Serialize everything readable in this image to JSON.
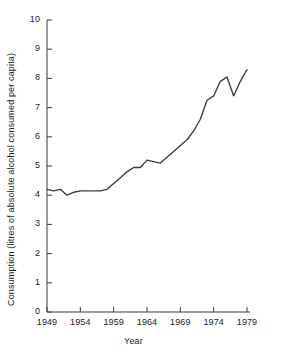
{
  "chart_data": {
    "type": "line",
    "title": "",
    "subtitle": "",
    "xlabel": "Year",
    "ylabel": "Consumption (litres of absolute alcohol consumed per capita)",
    "xlim": [
      1949,
      1979
    ],
    "ylim": [
      0,
      10
    ],
    "grid": false,
    "legend": null,
    "x_ticks": [
      1949,
      1954,
      1959,
      1964,
      1969,
      1974,
      1979
    ],
    "x_tick_labels": [
      "1949",
      "1954",
      "1959",
      "1964",
      "1969",
      "1974",
      "1979"
    ],
    "y_ticks": [
      0,
      1,
      2,
      3,
      4,
      5,
      6,
      7,
      8,
      9,
      10
    ],
    "y_tick_labels": [
      "0",
      "1",
      "2",
      "3",
      "4",
      "5",
      "6",
      "7",
      "8",
      "9",
      "10"
    ],
    "line_color": "#3a3a3a",
    "series": [
      {
        "name": "Consumption",
        "x": [
          1949,
          1950,
          1951,
          1952,
          1953,
          1954,
          1955,
          1956,
          1957,
          1958,
          1959,
          1960,
          1961,
          1962,
          1963,
          1964,
          1965,
          1966,
          1967,
          1968,
          1969,
          1970,
          1971,
          1972,
          1973,
          1974,
          1975,
          1976,
          1977,
          1978,
          1979
        ],
        "values": [
          4.2,
          4.15,
          4.2,
          4.0,
          4.1,
          4.15,
          4.15,
          4.15,
          4.15,
          4.2,
          4.4,
          4.6,
          4.8,
          4.95,
          4.95,
          5.2,
          5.15,
          5.1,
          5.3,
          5.5,
          5.7,
          5.9,
          6.2,
          6.6,
          7.25,
          7.4,
          7.9,
          8.05,
          7.4,
          7.9,
          8.3
        ]
      }
    ]
  },
  "axis": {
    "x_axis_name": "year-axis",
    "y_axis_name": "consumption-axis"
  }
}
